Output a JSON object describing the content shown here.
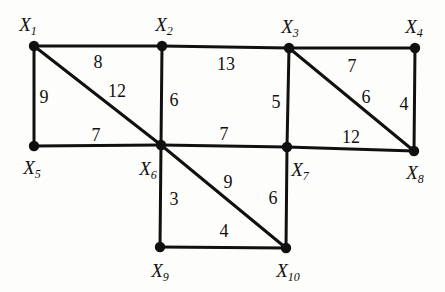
{
  "diagram": {
    "background_color": "#fdfdfb",
    "stroke_color": "#101010",
    "node_fill_color": "#101010"
  },
  "chart_data": {
    "type": "diagram",
    "title": "",
    "nodes": [
      {
        "id": "X1",
        "label": "X",
        "sub": "1",
        "x": 34,
        "y": 46,
        "label_x": 28,
        "label_y": 24
      },
      {
        "id": "X2",
        "label": "X",
        "sub": "2",
        "x": 162,
        "y": 46,
        "label_x": 164,
        "label_y": 24
      },
      {
        "id": "X3",
        "label": "X",
        "sub": "3",
        "x": 289,
        "y": 48,
        "label_x": 290,
        "label_y": 26
      },
      {
        "id": "X4",
        "label": "X",
        "sub": "4",
        "x": 415,
        "y": 48,
        "label_x": 414,
        "label_y": 26
      },
      {
        "id": "X5",
        "label": "X",
        "sub": "5",
        "x": 34,
        "y": 146,
        "label_x": 32,
        "label_y": 167
      },
      {
        "id": "X6",
        "label": "X",
        "sub": "6",
        "x": 161,
        "y": 145,
        "label_x": 148,
        "label_y": 168
      },
      {
        "id": "X7",
        "label": "X",
        "sub": "7",
        "x": 287,
        "y": 147,
        "label_x": 300,
        "label_y": 169
      },
      {
        "id": "X8",
        "label": "X",
        "sub": "8",
        "x": 414,
        "y": 151,
        "label_x": 415,
        "label_y": 172
      },
      {
        "id": "X9",
        "label": "X",
        "sub": "9",
        "x": 160,
        "y": 247,
        "label_x": 160,
        "label_y": 270
      },
      {
        "id": "X10",
        "label": "X",
        "sub": "10",
        "x": 286,
        "y": 248,
        "label_x": 288,
        "label_y": 270
      }
    ],
    "edges": [
      {
        "from": "X1",
        "to": "X2",
        "weight": "8",
        "label_x": 98,
        "label_y": 62
      },
      {
        "from": "X1",
        "to": "X5",
        "weight": "9",
        "label_x": 44,
        "label_y": 97
      },
      {
        "from": "X1",
        "to": "X6",
        "weight": "12",
        "label_x": 117,
        "label_y": 91
      },
      {
        "from": "X2",
        "to": "X3",
        "weight": "13",
        "label_x": 226,
        "label_y": 64
      },
      {
        "from": "X2",
        "to": "X6",
        "weight": "6",
        "label_x": 174,
        "label_y": 100
      },
      {
        "from": "X3",
        "to": "X4",
        "weight": "7",
        "label_x": 352,
        "label_y": 66
      },
      {
        "from": "X3",
        "to": "X7",
        "weight": "5",
        "label_x": 276,
        "label_y": 102
      },
      {
        "from": "X3",
        "to": "X8",
        "weight": "6",
        "label_x": 366,
        "label_y": 97
      },
      {
        "from": "X4",
        "to": "X8",
        "weight": "4",
        "label_x": 404,
        "label_y": 104
      },
      {
        "from": "X5",
        "to": "X6",
        "weight": "7",
        "label_x": 96,
        "label_y": 135
      },
      {
        "from": "X6",
        "to": "X7",
        "weight": "7",
        "label_x": 224,
        "label_y": 134
      },
      {
        "from": "X7",
        "to": "X8",
        "weight": "12",
        "label_x": 351,
        "label_y": 137
      },
      {
        "from": "X6",
        "to": "X9",
        "weight": "3",
        "label_x": 174,
        "label_y": 199
      },
      {
        "from": "X6",
        "to": "X10",
        "weight": "9",
        "label_x": 228,
        "label_y": 182
      },
      {
        "from": "X7",
        "to": "X10",
        "weight": "6",
        "label_x": 273,
        "label_y": 198
      },
      {
        "from": "X9",
        "to": "X10",
        "weight": "4",
        "label_x": 224,
        "label_y": 231
      }
    ]
  }
}
